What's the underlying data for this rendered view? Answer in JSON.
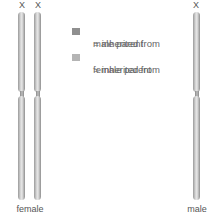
{
  "diagram": {
    "chromosome_label": "X",
    "groups": [
      {
        "label": "female",
        "chromosomes": 2
      },
      {
        "label": "male",
        "chromosomes": 1
      }
    ],
    "legend": [
      {
        "symbol": "=",
        "text_line1": "inherited from",
        "text_line2": "male parent",
        "color": "#8f8f8f"
      },
      {
        "symbol": "=",
        "text_line1": "inherited from",
        "text_line2": "female parent",
        "color": "#b4b4b4"
      }
    ]
  }
}
